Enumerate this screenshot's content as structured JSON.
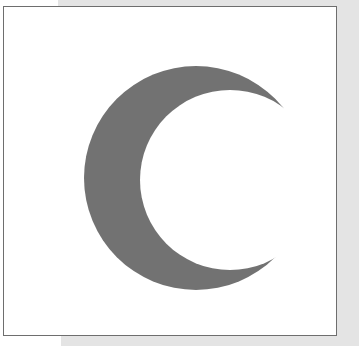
{
  "image": {
    "subject": "crescent-moon",
    "colors": {
      "crescent": "#727272",
      "frame_border": "#6e6e6e",
      "frame_fill": "#ffffff",
      "background": "#e4e4e4"
    }
  }
}
